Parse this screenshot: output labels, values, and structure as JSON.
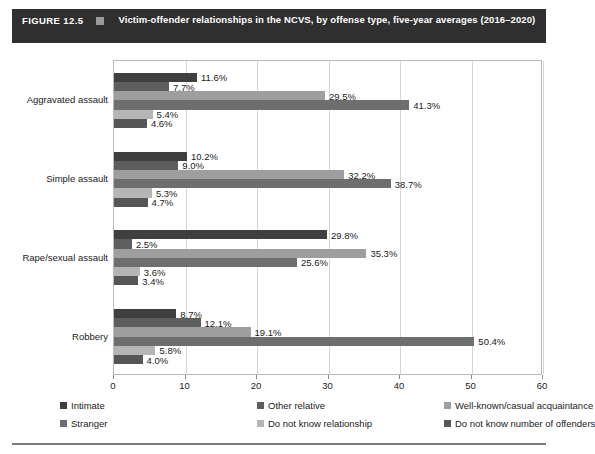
{
  "figure": {
    "number_label": "FIGURE 12.5",
    "title": "Victim-offender relationships in the NCVS, by offense type, five-year averages (2016–2020)",
    "marker_icon": "square-marker-icon"
  },
  "chart_data": {
    "type": "bar",
    "orientation": "horizontal",
    "title": "Victim-offender relationships in the NCVS, by offense type, five-year averages (2016–2020)",
    "xlabel": "",
    "ylabel": "",
    "xlim": [
      0,
      60
    ],
    "xticks": [
      0,
      10,
      20,
      30,
      40,
      50,
      60
    ],
    "xtick_labels": [
      "0",
      "10",
      "20",
      "30",
      "40",
      "50",
      "60"
    ],
    "grid": true,
    "legend_position": "bottom",
    "value_suffix": "%",
    "categories": [
      "Aggravated assault",
      "Simple assault",
      "Rape/sexual assault",
      "Robbery"
    ],
    "series": [
      {
        "name": "Intimate",
        "color": "#3f3f3f",
        "values": [
          11.6,
          10.2,
          29.8,
          8.7
        ],
        "labels": [
          "11.6%",
          "10.2%",
          "29.8%",
          "8.7%"
        ]
      },
      {
        "name": "Other relative",
        "color": "#5e5e5e",
        "values": [
          7.7,
          9.0,
          2.5,
          12.1
        ],
        "labels": [
          "7.7%",
          "9.0%",
          "2.5%",
          "12.1%"
        ]
      },
      {
        "name": "Well-known/casual acquaintance",
        "color": "#9e9e9e",
        "values": [
          29.5,
          32.2,
          35.3,
          19.1
        ],
        "labels": [
          "29.5%",
          "32.2%",
          "35.3%",
          "19.1%"
        ]
      },
      {
        "name": "Stranger",
        "color": "#6e6e6e",
        "values": [
          41.3,
          38.7,
          25.6,
          50.4
        ],
        "labels": [
          "41.3%",
          "38.7%",
          "25.6%",
          "50.4%"
        ]
      },
      {
        "name": "Do not know relationship",
        "color": "#b5b5b5",
        "values": [
          5.4,
          5.3,
          3.6,
          5.8
        ],
        "labels": [
          "5.4%",
          "5.3%",
          "3.6%",
          "5.8%"
        ]
      },
      {
        "name": "Do not know number of offenders",
        "color": "#565656",
        "values": [
          4.6,
          4.7,
          3.4,
          4.0
        ],
        "labels": [
          "4.6%",
          "4.7%",
          "3.4%",
          "4.0%"
        ]
      }
    ]
  }
}
